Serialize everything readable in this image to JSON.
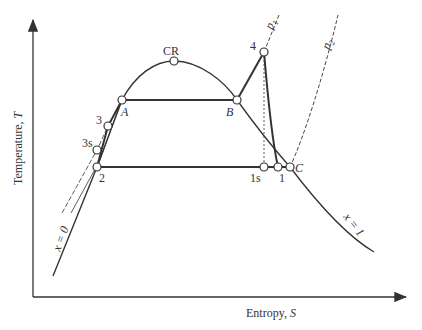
{
  "diagram": {
    "axes": {
      "y_label": "Temperature, ",
      "y_symbol": "T",
      "x_label": "Entropy, ",
      "x_symbol": "S"
    },
    "points": {
      "CR": "CR",
      "A": "A",
      "B": "B",
      "p4": "4",
      "p3": "3",
      "p3s": "3s",
      "p2": "2",
      "p1s": "1s",
      "p1": "1",
      "C": "C"
    },
    "curves": {
      "p1_label": "p",
      "p1_sub": "1",
      "p2_label": "p",
      "p2_sub": "2",
      "x0_label": "x = 0",
      "x1_label": "x = 1"
    },
    "colors": {
      "line": "#333333",
      "background": "#ffffff"
    }
  }
}
